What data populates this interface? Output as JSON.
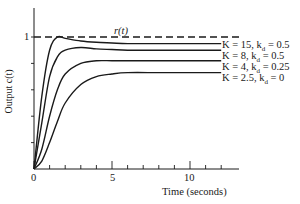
{
  "chart_data": {
    "type": "line",
    "title": "",
    "xlabel": "Time (seconds)",
    "ylabel": "Output c(t)",
    "xlim": [
      0,
      13
    ],
    "ylim": [
      0,
      1.2
    ],
    "x_ticks": [
      0,
      5,
      10
    ],
    "x_minor_ticks": [
      1,
      2,
      3,
      4,
      6,
      7,
      8,
      9,
      11,
      12
    ],
    "y_ticks": [
      1
    ],
    "y_minor_ticks": [
      0.2,
      0.4,
      0.6,
      0.8
    ],
    "grid": false,
    "reference": {
      "name": "r(t)",
      "value": 1,
      "style": "dashed"
    },
    "x": [
      0,
      0.5,
      1,
      1.5,
      2,
      3,
      4,
      5,
      6,
      8,
      10,
      12
    ],
    "series": [
      {
        "name": "K = 15, k_d = 0.5",
        "values": [
          0,
          0.55,
          0.9,
          1.0,
          0.99,
          0.97,
          0.96,
          0.955,
          0.95,
          0.95,
          0.95,
          0.95
        ]
      },
      {
        "name": "K = 8, k_d = 0.5",
        "values": [
          0,
          0.35,
          0.7,
          0.85,
          0.9,
          0.92,
          0.91,
          0.905,
          0.9,
          0.9,
          0.9,
          0.9
        ]
      },
      {
        "name": "K = 4, k_d = 0.25",
        "values": [
          0,
          0.15,
          0.4,
          0.6,
          0.72,
          0.8,
          0.82,
          0.82,
          0.82,
          0.82,
          0.82,
          0.82
        ]
      },
      {
        "name": "K = 2.5, k_d = 0",
        "values": [
          0,
          0.06,
          0.2,
          0.36,
          0.5,
          0.64,
          0.7,
          0.72,
          0.73,
          0.73,
          0.73,
          0.73
        ]
      }
    ],
    "legend_position": "right (inline labels at curve ends)"
  },
  "labels": {
    "reference": "r(t)",
    "ylabel": "Output c(t)",
    "xlabel": "Time (seconds)",
    "ytick_1": "1",
    "xtick_0": "0",
    "xtick_5": "5",
    "xtick_10": "10",
    "series_0": "K = 15, k",
    "series_0_sub": "d",
    "series_0_val": " = 0.5",
    "series_1": "K = 8, k",
    "series_1_sub": "d",
    "series_1_val": " = 0.5",
    "series_2": "K = 4, k",
    "series_2_sub": "d",
    "series_2_val": " = 0.25",
    "series_3": "K = 2.5, k",
    "series_3_sub": "d",
    "series_3_val": " = 0"
  },
  "colors": {
    "line": "#1a1a1a",
    "background": "#ffffff"
  }
}
